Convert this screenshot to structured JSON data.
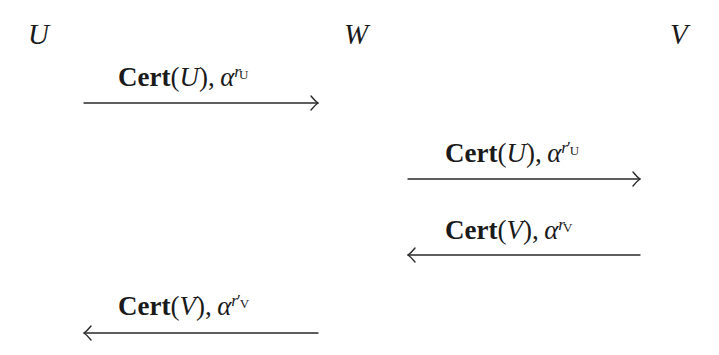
{
  "diagram": {
    "type": "protocol-message-sequence",
    "parties": [
      {
        "id": "U",
        "label": "U",
        "x": 28,
        "y": 22
      },
      {
        "id": "W",
        "label": "W",
        "x": 344,
        "y": 22
      },
      {
        "id": "V",
        "label": "V",
        "x": 670,
        "y": 22
      }
    ],
    "messages": [
      {
        "from": "U",
        "to": "W",
        "direction": "right",
        "fn": "Cert",
        "arg": "U",
        "alpha": "α",
        "exp_base": "r",
        "exp_prime": "",
        "exp_sub": "U",
        "label_x": 118,
        "label_y": 64,
        "arrow": {
          "x1": 84,
          "x2": 318,
          "y": 103
        }
      },
      {
        "from": "W",
        "to": "V",
        "direction": "right",
        "fn": "Cert",
        "arg": "U",
        "alpha": "α",
        "exp_base": "r",
        "exp_prime": "′",
        "exp_sub": "U",
        "label_x": 445,
        "label_y": 140,
        "arrow": {
          "x1": 408,
          "x2": 640,
          "y": 179
        }
      },
      {
        "from": "V",
        "to": "W",
        "direction": "left",
        "fn": "Cert",
        "arg": "V",
        "alpha": "α",
        "exp_base": "r",
        "exp_prime": "",
        "exp_sub": "V",
        "label_x": 445,
        "label_y": 217,
        "arrow": {
          "x1": 640,
          "x2": 408,
          "y": 255
        }
      },
      {
        "from": "W",
        "to": "U",
        "direction": "left",
        "fn": "Cert",
        "arg": "V",
        "alpha": "α",
        "exp_base": "r",
        "exp_prime": "′",
        "exp_sub": "V",
        "label_x": 118,
        "label_y": 293,
        "arrow": {
          "x1": 318,
          "x2": 84,
          "y": 333
        }
      }
    ],
    "colors": {
      "ink": "#1a1a1a",
      "arrow": "#2a2a2a",
      "background": "#ffffff"
    }
  },
  "text": {
    "party_u": "U",
    "party_w": "W",
    "party_v": "V",
    "m1": {
      "fn": "Cert",
      "open": "(",
      "arg": "U",
      "close": ")",
      "comma": ",",
      "alpha": "α",
      "r": "r",
      "prime": "",
      "sub": "U"
    },
    "m2": {
      "fn": "Cert",
      "open": "(",
      "arg": "U",
      "close": ")",
      "comma": ",",
      "alpha": "α",
      "r": "r",
      "prime": "′",
      "sub": "U"
    },
    "m3": {
      "fn": "Cert",
      "open": "(",
      "arg": "V",
      "close": ")",
      "comma": ",",
      "alpha": "α",
      "r": "r",
      "prime": "",
      "sub": "V"
    },
    "m4": {
      "fn": "Cert",
      "open": "(",
      "arg": "V",
      "close": ")",
      "comma": ",",
      "alpha": "α",
      "r": "r",
      "prime": "′",
      "sub": "V"
    }
  }
}
